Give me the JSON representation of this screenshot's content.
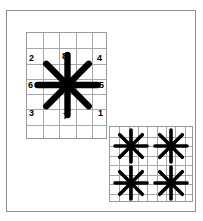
{
  "figure": {
    "background_color": "#ffffff",
    "ink_color": "#000000",
    "frame": {
      "border_color": "#8f8f8f",
      "x": 6,
      "y": 10,
      "width": 190,
      "height": 202
    }
  },
  "panels": [
    {
      "id": "main-star-panel",
      "role": "single-structuring-element",
      "grid": {
        "columns": 5,
        "rows": 7,
        "line_color": "#a8a8a8",
        "border_color": "#9a9a9a"
      },
      "star": {
        "spokes": 8,
        "center_x": 40.5,
        "center_y": 52,
        "arm_length": 30,
        "arm_width": 6.4,
        "color": "#000000"
      },
      "spoke_labels": [
        {
          "text": "2",
          "direction": "north-west",
          "left": 2,
          "top": 21
        },
        {
          "text": "8",
          "direction": "north",
          "left": 35,
          "top": 19
        },
        {
          "text": "4",
          "direction": "north-east",
          "left": 70,
          "top": 21
        },
        {
          "text": "6",
          "direction": "west",
          "left": 1,
          "top": 48
        },
        {
          "text": "5",
          "direction": "east",
          "left": 72,
          "top": 48
        },
        {
          "text": "3",
          "direction": "south-west",
          "left": 2,
          "top": 76
        },
        {
          "text": "7",
          "direction": "south",
          "left": 36,
          "top": 79
        },
        {
          "text": "1",
          "direction": "south-east",
          "left": 71,
          "top": 76
        }
      ]
    },
    {
      "id": "tiled-star-panel",
      "role": "tiled-structuring-elements",
      "grid": {
        "columns": 9,
        "rows": 8,
        "line_color": "#a8a8a8",
        "border_color": "#9a9a9a"
      },
      "stars": [
        {
          "center_x": 21,
          "center_y": 19,
          "arm_length": 16,
          "arm_width": 3.6,
          "color": "#000000"
        },
        {
          "center_x": 61,
          "center_y": 19,
          "arm_length": 16,
          "arm_width": 3.6,
          "color": "#000000"
        },
        {
          "center_x": 21,
          "center_y": 56,
          "arm_length": 16,
          "arm_width": 3.6,
          "color": "#000000"
        },
        {
          "center_x": 61,
          "center_y": 56,
          "arm_length": 16,
          "arm_width": 3.6,
          "color": "#000000"
        }
      ]
    }
  ]
}
